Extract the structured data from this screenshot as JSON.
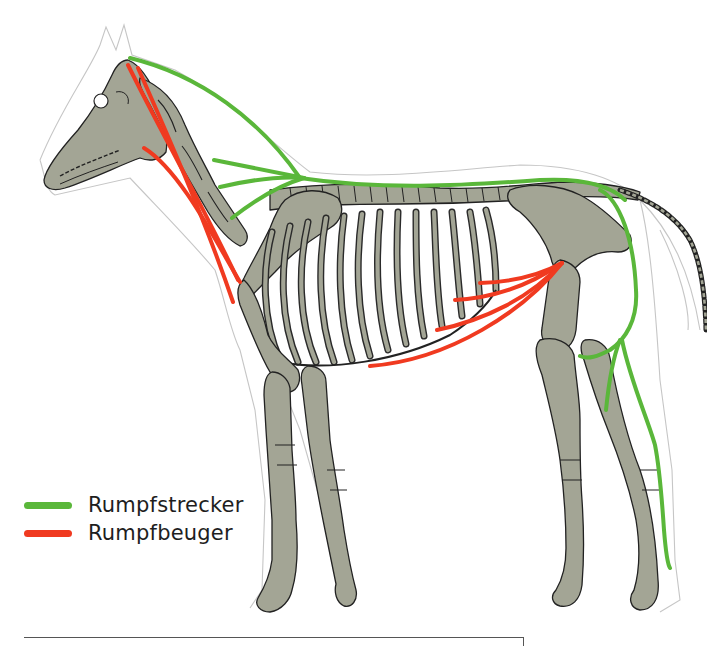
{
  "figure": {
    "colors": {
      "extensor": "#5ab73a",
      "flexor": "#f03a20",
      "bone": "#a3a595",
      "bone_outline": "#222222",
      "body_outline": "#c6c6c6"
    }
  },
  "legend": {
    "items": [
      {
        "label": "Rumpfstrecker",
        "color": "#5ab73a",
        "name": "extensor"
      },
      {
        "label": "Rumpfbeuger",
        "color": "#f03a20",
        "name": "flexor"
      }
    ]
  }
}
